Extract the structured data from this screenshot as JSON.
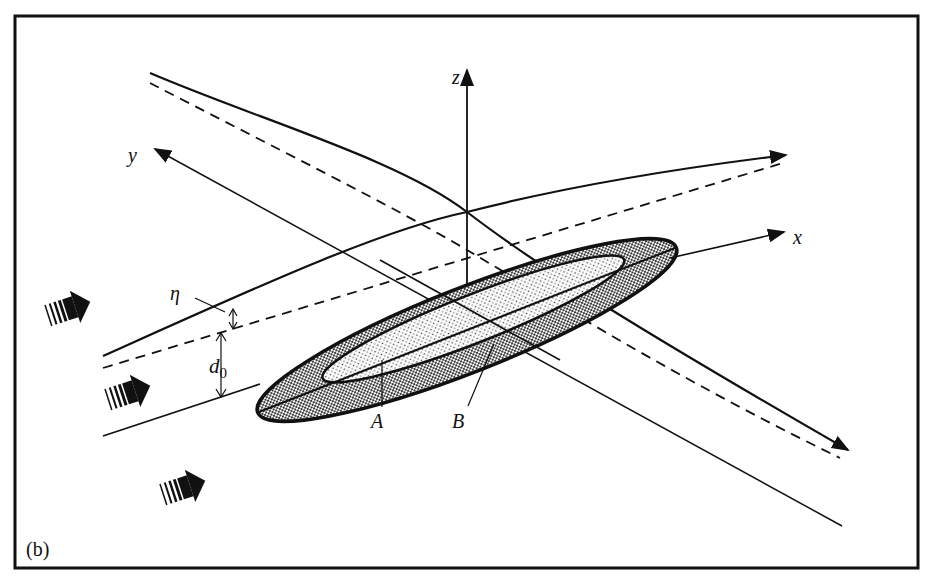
{
  "figure": {
    "panel_label": "(b)",
    "axes": {
      "x_label": "x",
      "y_label": "y",
      "z_label": "z"
    },
    "annotations": {
      "eta": "η",
      "d0_main": "d",
      "d0_sub": "0",
      "point_A": "A",
      "point_B": "B"
    },
    "flow_arrows": 3,
    "colors": {
      "ink": "#111111",
      "background": "#ffffff",
      "outer_ring_fill": "#8a8a8a",
      "inner_core_fill": "#d9d9d9"
    }
  }
}
